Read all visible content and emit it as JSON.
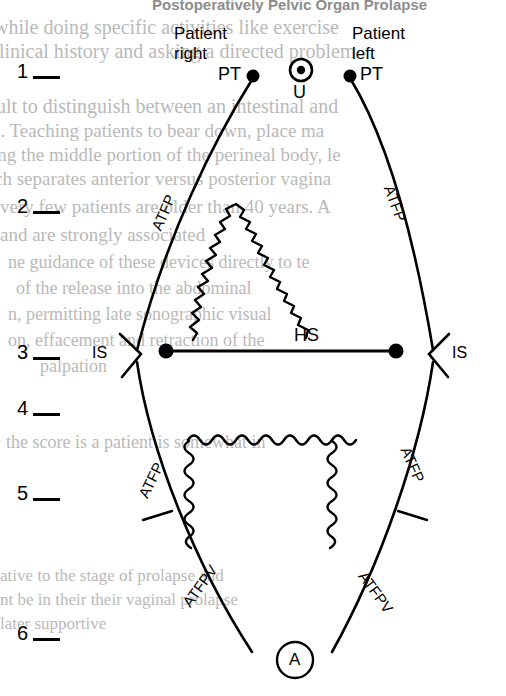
{
  "page": {
    "width": 506,
    "height": 696,
    "background": "#ffffff",
    "ink": "#000000"
  },
  "bleed_through": {
    "note": "faint show-through text from the reverse side of the printed page",
    "color": "#b9b9b9",
    "title": "Postoperatively Pelvic Organ Prolapse",
    "lines": [
      "while doing specific activities like exercise",
      "clinical history and asking a directed problem",
      "ult to distinguish between an intestinal and",
      "e.  Teaching patients to bear down, place ma",
      "ing the middle portion of the perineal body, le",
      "ch separates anterior versus posterior vagina",
      "very few patients are older than 40 years. A",
      "and are strongly associated",
      "ne guidance of these devices directly to te",
      "of the release into the abdominal",
      "n, permitting late sonographic visual",
      "on, effacement and retraction of the",
      "palpation"
    ],
    "lines_lower": [
      "the score is a patient is somewhat in",
      "ative to the stage of prolapse and",
      "nt be in their their vaginal prolapse",
      "later supportive"
    ]
  },
  "scale": {
    "name": "vertical-reference-scale",
    "levels": [
      {
        "label": "1",
        "y": 74
      },
      {
        "label": "2",
        "y": 209
      },
      {
        "label": "3",
        "y": 355
      },
      {
        "label": "4",
        "y": 411
      },
      {
        "label": "5",
        "y": 496
      },
      {
        "label": "6",
        "y": 636
      }
    ]
  },
  "orientation": {
    "right_label": "Patient\nright",
    "right_line_1": "Patient",
    "right_line_2": "right",
    "left_line_1": "Patient",
    "left_line_2": "left"
  },
  "landmarks": {
    "pt_left": {
      "label": "PT",
      "x": 253,
      "y": 75,
      "full": "pubic tubercle"
    },
    "pt_right": {
      "label": "PT",
      "x": 350,
      "y": 75,
      "full": "pubic tubercle"
    },
    "u": {
      "label": "U",
      "x": 301,
      "y": 70,
      "full": "urethra"
    },
    "is_left": {
      "label": "IS",
      "x": 114,
      "y": 355,
      "full": "ischial spine"
    },
    "is_right": {
      "label": "IS",
      "x": 455,
      "y": 355,
      "full": "ischial spine"
    },
    "hs": {
      "label": "HS",
      "x": 280,
      "y": 340,
      "full": "hymenal / horizontal span"
    },
    "a": {
      "label": "A",
      "x": 295,
      "y": 660,
      "full": "anus"
    }
  },
  "arcs": {
    "atfp_upper_left": {
      "label": "ATFP",
      "full": "arcus tendineus fasciae pelvis"
    },
    "atfp_upper_right": {
      "label": "ATFP",
      "full": "arcus tendineus fasciae pelvis"
    },
    "atfp_lower_left": {
      "label": "ATFP",
      "full": "arcus tendineus fasciae pelvis"
    },
    "atfp_lower_right": {
      "label": "ATFP",
      "full": "arcus tendineus fasciae pelvis"
    },
    "atfpv_left": {
      "label": "ATFPV",
      "full": "arcus tendineus fasciae pelvis visceralis"
    },
    "atfpv_right": {
      "label": "ATFPV",
      "full": "arcus tendineus fasciae pelvis visceralis"
    }
  },
  "shapes": {
    "upper_jagged": {
      "name": "anterior-vaginal-wall-outline",
      "style": "zigzag"
    },
    "lower_wavy": {
      "name": "posterior-vaginal-wall-outline",
      "style": "wavy"
    },
    "hs_line": {
      "name": "horizontal-support-line",
      "x1": 166,
      "x2": 396,
      "y": 351
    }
  }
}
